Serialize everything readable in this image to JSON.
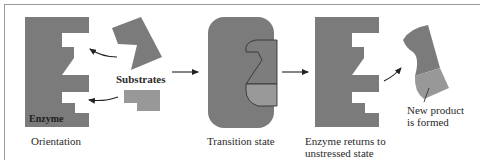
{
  "figure": {
    "type": "enzyme-substrate induced-fit diagram",
    "colors": {
      "enzyme": "#7b7b7b",
      "substrate_dark": "#7b7b7b",
      "substrate_light": "#989898",
      "outline": "#3a3a3a",
      "arrow": "#222222",
      "frame": "#9a9a9a",
      "text": "#2a2a2a"
    }
  },
  "stages": [
    {
      "id": "orientation",
      "caption": "Orientation"
    },
    {
      "id": "transition",
      "caption": "Transition state"
    },
    {
      "id": "return",
      "caption": "Enzyme returns to\nunstressed state"
    },
    {
      "id": "product",
      "caption": "New product\nis formed"
    }
  ],
  "labels": {
    "enzyme": "Enzyme",
    "substrates": "Substrates"
  }
}
